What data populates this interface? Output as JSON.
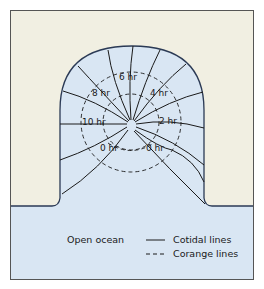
{
  "colors": {
    "land": "#f1efe2",
    "water": "#d9e6f3",
    "outline": "#2b3a55",
    "line": "#1a1a1a",
    "frame": "#555555"
  },
  "labels": {
    "hr6": "6 hr",
    "hr8": "8 hr",
    "hr4": "4 hr",
    "hr10": "10 hr",
    "hr2": "2 hr",
    "hr0_left": "0 hr",
    "hr0_right": "0 hr"
  },
  "legend": {
    "open_ocean": "Open ocean",
    "cotidal": "Cotidal lines",
    "corange": "Corange lines"
  }
}
